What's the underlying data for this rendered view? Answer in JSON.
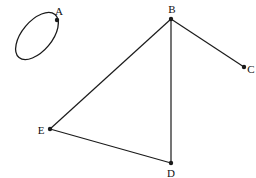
{
  "diagram": {
    "type": "graph",
    "stroke_color": "#1a1a1a",
    "nodes": [
      {
        "id": "A",
        "label": "A",
        "x": 57,
        "y": 20,
        "label_x": 59,
        "label_y": 11
      },
      {
        "id": "B",
        "label": "B",
        "x": 171,
        "y": 19,
        "label_x": 172,
        "label_y": 9
      },
      {
        "id": "C",
        "label": "C",
        "x": 244,
        "y": 67,
        "label_x": 251,
        "label_y": 69
      },
      {
        "id": "D",
        "label": "D",
        "x": 171,
        "y": 163,
        "label_x": 171,
        "label_y": 173
      },
      {
        "id": "E",
        "label": "E",
        "x": 50,
        "y": 129,
        "label_x": 41,
        "label_y": 130
      }
    ],
    "edges": [
      {
        "from": "B",
        "to": "C"
      },
      {
        "from": "B",
        "to": "E"
      },
      {
        "from": "B",
        "to": "D"
      },
      {
        "from": "E",
        "to": "D"
      }
    ],
    "loops": [
      {
        "node": "A",
        "shape": "ellipse",
        "cx": 37,
        "cy": 36,
        "rx": 28,
        "ry": 15,
        "rotation": -50
      }
    ]
  }
}
